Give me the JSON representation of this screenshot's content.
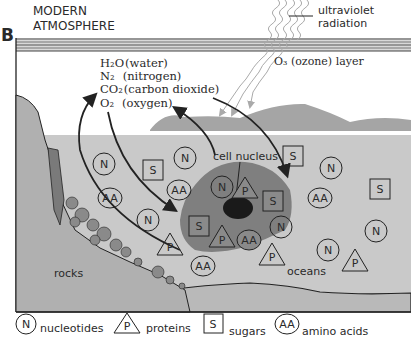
{
  "figure": {
    "panel_label": "B",
    "title_line1": "MODERN",
    "title_line2": "ATMOSPHERE",
    "uv_label_line1": "ultraviolet",
    "uv_label_line2": "radiation",
    "ozone_label": "O₃ (ozone) layer",
    "gases": [
      {
        "formula": "H₂O",
        "name": "(water)"
      },
      {
        "formula": "N₂",
        "name": "(nitrogen)"
      },
      {
        "formula": "CO₂",
        "name": "(carbon dioxide)"
      },
      {
        "formula": "O₂",
        "name": "(oxygen)"
      }
    ],
    "cell_nucleus_label": "cell nucleus",
    "rocks_label": "rocks",
    "oceans_label": "oceans",
    "colors": {
      "sky": "#ffffff",
      "land": "#a9a9a9",
      "ocean": "#c8c8c8",
      "cell": "#7d7d7d",
      "nucleus": "#1a1a1a",
      "line": "#222222"
    }
  },
  "legend": [
    {
      "symbol": "N",
      "shape": "circle",
      "label": "nucleotides"
    },
    {
      "symbol": "P",
      "shape": "triangle",
      "label": "proteins"
    },
    {
      "symbol": "S",
      "shape": "square",
      "label": "sugars"
    },
    {
      "symbol": "AA",
      "shape": "ellipse",
      "label": "amino acids"
    }
  ],
  "molecules": {
    "N": "N",
    "P": "P",
    "S": "S",
    "AA": "AA"
  }
}
